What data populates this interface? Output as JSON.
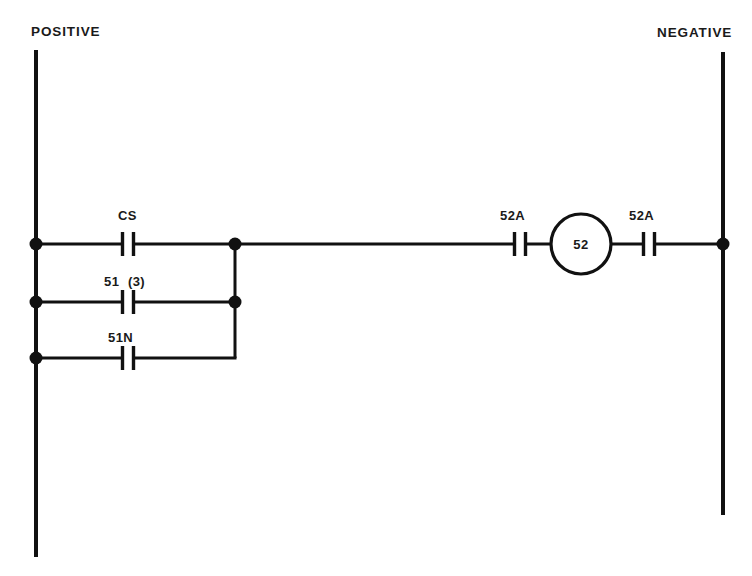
{
  "diagram": {
    "type": "ladder-elementary-control-diagram",
    "background_color": "#ffffff",
    "line_color": "#111111",
    "rails": {
      "positive": {
        "label": "POSITIVE",
        "label_x": 31,
        "label_y": 36,
        "x": 36,
        "y_top": 50,
        "y_bottom": 557
      },
      "negative": {
        "label": "NEGATIVE",
        "label_x": 657,
        "label_y": 37,
        "x": 723,
        "y_top": 52,
        "y_bottom": 515
      }
    },
    "branches": [
      {
        "id": "branch-cs",
        "label": "CS",
        "label_x": 118,
        "label_y": 220,
        "y": 244,
        "contact_x": 128,
        "start_x": 36,
        "end_x": 235,
        "left_node": true,
        "right_node": true
      },
      {
        "id": "branch-51-3",
        "label": "51 (3)",
        "label_left": "51",
        "label_right": "(3)",
        "label_x": 106,
        "label_y": 286,
        "y": 302,
        "contact_x": 128,
        "start_x": 36,
        "end_x": 235,
        "left_node": true,
        "right_node": true
      },
      {
        "id": "branch-51n",
        "label": "51N",
        "label_x": 110,
        "label_y": 342,
        "y": 358,
        "contact_x": 128,
        "start_x": 36,
        "end_x": 235,
        "left_node": true,
        "right_node": false
      }
    ],
    "junction_bar": {
      "x": 235,
      "y_top": 244,
      "y_bottom": 358
    },
    "main_rung": {
      "y": 244,
      "start_x": 235,
      "end_x": 723,
      "contacts": [
        {
          "id": "contact-52a-left",
          "label": "52A",
          "label_x": 502,
          "label_y": 220,
          "x": 520
        },
        {
          "id": "contact-52a-right",
          "label": "52A",
          "label_x": 631,
          "label_y": 220,
          "x": 649
        }
      ],
      "coil": {
        "id": "coil-52",
        "label": "52",
        "cx": 581,
        "cy": 244,
        "r": 30
      },
      "end_node": true
    },
    "contact_geometry": {
      "bar_half_height": 12,
      "gap_half_width": 5.5
    },
    "node_radius": 6.5
  }
}
